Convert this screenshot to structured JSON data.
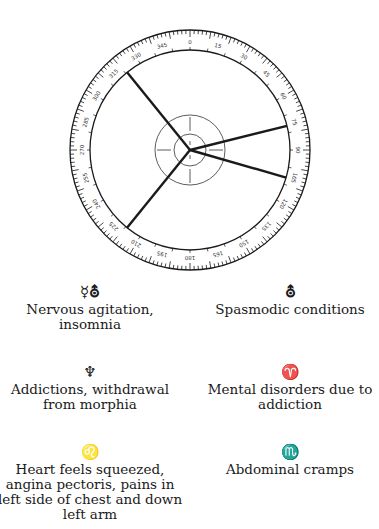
{
  "dial": {
    "center": [
      190,
      150
    ],
    "outer_radius": 120,
    "inner_radius": 100,
    "middle_circle_radius": 35,
    "small_circle_radius": 16,
    "ring_label_step_degrees": 30,
    "pointer_angles_degrees": [
      129,
      14,
      -16,
      -129
    ],
    "line_color": "#1a1a1a"
  },
  "entries": [
    {
      "glyph": "☿⛢",
      "text": "Nervous agitation, insomnia"
    },
    {
      "glyph": "⛢",
      "text": "Spasmodic conditions"
    },
    {
      "glyph": "♆",
      "text": "Addictions, withdrawal from morphia"
    },
    {
      "glyph": "♈",
      "text": "Mental disorders due to addiction"
    },
    {
      "glyph": "♌",
      "text": "Heart feels squeezed, angina pectoris, pains in left side of chest and down left arm"
    },
    {
      "glyph": "♏",
      "text": "Abdominal cramps"
    }
  ]
}
